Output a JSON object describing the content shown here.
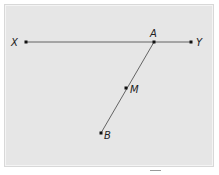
{
  "diagram": {
    "type": "geometry",
    "background_color": "#e6e6e6",
    "line_color": "#555555",
    "point_color": "#111111",
    "points": [
      {
        "id": "X",
        "label": "X",
        "x": 26,
        "y": 42
      },
      {
        "id": "A",
        "label": "A",
        "x": 154,
        "y": 42
      },
      {
        "id": "Y",
        "label": "Y",
        "x": 191,
        "y": 42
      },
      {
        "id": "M",
        "label": "M",
        "x": 126,
        "y": 88
      },
      {
        "id": "B",
        "label": "B",
        "x": 101,
        "y": 133
      }
    ],
    "segments": [
      {
        "from": "X",
        "to": "Y"
      },
      {
        "from": "A",
        "to": "B"
      }
    ],
    "labels": {
      "X": "X",
      "A": "A",
      "Y": "Y",
      "M": "M",
      "B": "B"
    }
  }
}
